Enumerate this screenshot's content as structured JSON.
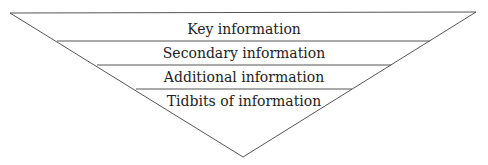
{
  "diagram": {
    "type": "inverted-pyramid",
    "layers": [
      {
        "label": "Key information"
      },
      {
        "label": "Secondary information"
      },
      {
        "label": "Additional information"
      },
      {
        "label": "Tidbits of information"
      }
    ],
    "stroke_color": "#555555"
  }
}
